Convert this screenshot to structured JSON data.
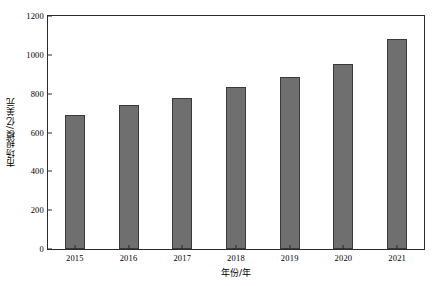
{
  "chart_data": {
    "type": "bar",
    "title": "",
    "xlabel": "年份/年",
    "ylabel": "市场规模/亿美元",
    "categories": [
      "2015",
      "2016",
      "2017",
      "2018",
      "2019",
      "2020",
      "2021"
    ],
    "values": [
      690,
      740,
      778,
      832,
      886,
      955,
      1082
    ],
    "ylim": [
      0,
      1200
    ],
    "yticks": [
      "0",
      "200",
      "400",
      "600",
      "800",
      "1000",
      "1200"
    ],
    "ytick_values": [
      0,
      200,
      400,
      600,
      800,
      1000,
      1200
    ],
    "grid": false,
    "legend": null,
    "bar_color": "#6f6f6f",
    "bar_edge_color": "#3a3a3a",
    "frame_color": "#2b2b2b",
    "background": "#ffffff"
  }
}
